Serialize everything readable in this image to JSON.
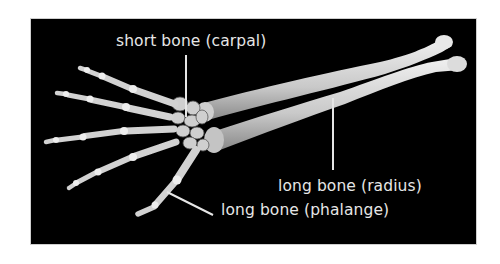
{
  "figure": {
    "background_color": "#000000",
    "bone_color": "#d8d8d8",
    "label_color": "#e6e6e6",
    "labels": [
      {
        "id": "carpal",
        "text": "short bone (carpal)"
      },
      {
        "id": "radius",
        "text": "long bone (radius)"
      },
      {
        "id": "phalange",
        "text": "long bone (phalange)"
      }
    ]
  }
}
